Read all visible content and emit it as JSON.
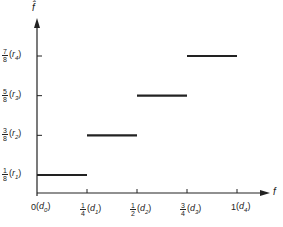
{
  "chart_data": {
    "type": "line",
    "subtype": "step",
    "title": "",
    "xlabel": "f",
    "ylabel": "f̂",
    "xlim": [
      0,
      1
    ],
    "ylim": [
      0,
      1
    ],
    "grid": false,
    "legend": null,
    "x_ticks": [
      {
        "value": 0,
        "label": "0",
        "sub_label": "d",
        "sub_index": "0"
      },
      {
        "value": 0.25,
        "num": "1",
        "den": "4",
        "sub_label": "d",
        "sub_index": "1"
      },
      {
        "value": 0.5,
        "num": "1",
        "den": "2",
        "sub_label": "d",
        "sub_index": "2"
      },
      {
        "value": 0.75,
        "num": "3",
        "den": "4",
        "sub_label": "d",
        "sub_index": "3"
      },
      {
        "value": 1,
        "label": "1",
        "sub_label": "d",
        "sub_index": "4"
      }
    ],
    "y_ticks": [
      {
        "value": 0.125,
        "num": "1",
        "den": "8",
        "sub_label": "r",
        "sub_index": "1"
      },
      {
        "value": 0.375,
        "num": "3",
        "den": "8",
        "sub_label": "r",
        "sub_index": "2"
      },
      {
        "value": 0.625,
        "num": "5",
        "den": "8",
        "sub_label": "r",
        "sub_index": "3"
      },
      {
        "value": 0.875,
        "num": "7",
        "den": "8",
        "sub_label": "r",
        "sub_index": "4"
      }
    ],
    "segments": [
      {
        "x_start": 0,
        "x_end": 0.25,
        "y": 0.125
      },
      {
        "x_start": 0.25,
        "x_end": 0.5,
        "y": 0.375
      },
      {
        "x_start": 0.5,
        "x_end": 0.75,
        "y": 0.625
      },
      {
        "x_start": 0.75,
        "x_end": 1,
        "y": 0.875
      }
    ],
    "line_color": "#222222"
  }
}
